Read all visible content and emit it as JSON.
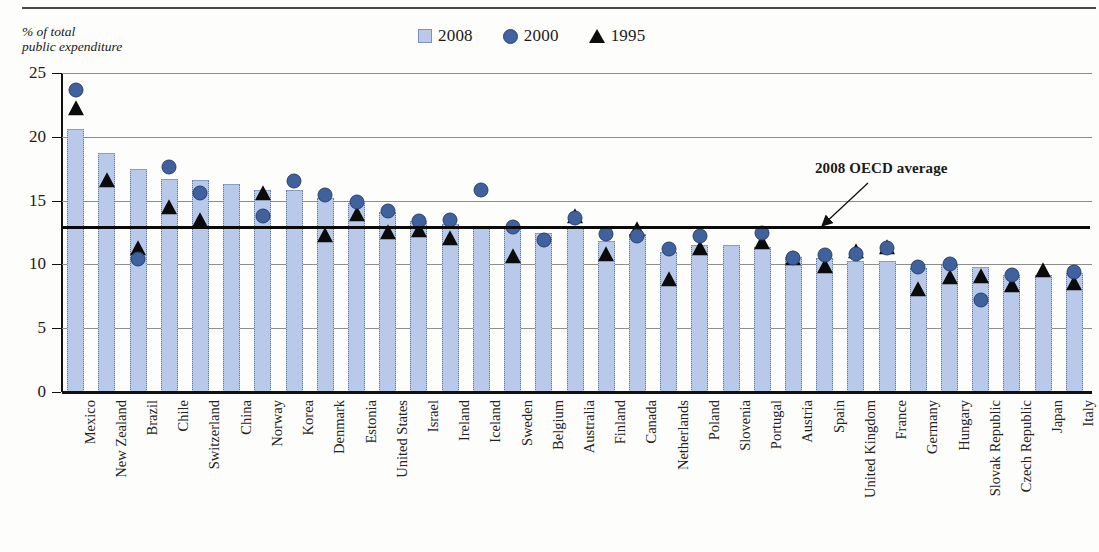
{
  "figure": {
    "y_axis_title": "% of total\npublic expenditure",
    "annotation": "2008 OECD average",
    "legend": [
      {
        "label": "2008",
        "marker": "bar-swatch-icon",
        "color": "#b9c9e9"
      },
      {
        "label": "2000",
        "marker": "circle-icon",
        "color": "#3f619e"
      },
      {
        "label": "1995",
        "marker": "triangle-icon",
        "color": "#0b0b0b"
      }
    ]
  },
  "chart_data": {
    "type": "bar",
    "title": "",
    "subtitle": "",
    "xlabel": "",
    "ylabel": "% of total public expenditure",
    "ylim": [
      0,
      25
    ],
    "yticks": [
      0,
      5,
      10,
      15,
      20,
      25
    ],
    "grid": true,
    "legend_position": "top-center",
    "annotations": [
      {
        "text": "2008 OECD average",
        "value": 12.9,
        "type": "reference-line"
      }
    ],
    "reference_line": {
      "label": "2008 OECD average",
      "value": 12.9
    },
    "categories": [
      "Mexico",
      "New Zealand",
      "Brazil",
      "Chile",
      "Switzerland",
      "China",
      "Norway",
      "Korea",
      "Denmark",
      "Estonia",
      "United States",
      "Israel",
      "Ireland",
      "Iceland",
      "Sweden",
      "Belgium",
      "Australia",
      "Finland",
      "Canada",
      "Netherlands",
      "Poland",
      "Slovenia",
      "Portugal",
      "Austria",
      "Spain",
      "United Kingdom",
      "France",
      "Germany",
      "Hungary",
      "Slovak Republic",
      "Czech Republic",
      "Japan",
      "Italy"
    ],
    "series": [
      {
        "name": "2008",
        "type": "bar",
        "values": [
          20.6,
          18.7,
          17.5,
          16.7,
          16.6,
          16.3,
          15.8,
          15.8,
          15.2,
          14.8,
          14.1,
          13.4,
          13.2,
          13.0,
          13.0,
          12.5,
          13.0,
          11.8,
          12.4,
          11.0,
          11.5,
          11.5,
          11.4,
          10.6,
          10.5,
          10.3,
          10.3,
          9.7,
          10.0,
          9.8,
          9.2,
          9.2,
          9.3
        ]
      },
      {
        "name": "2000",
        "type": "scatter",
        "marker": "circle",
        "values": [
          23.7,
          null,
          10.4,
          17.6,
          15.6,
          null,
          13.8,
          16.5,
          15.4,
          14.9,
          14.2,
          13.4,
          13.5,
          15.8,
          12.9,
          11.9,
          13.6,
          12.4,
          12.2,
          11.2,
          12.2,
          null,
          12.5,
          10.5,
          10.7,
          10.8,
          11.3,
          9.8,
          10.0,
          7.2,
          9.2,
          null,
          9.4
        ]
      },
      {
        "name": "1995",
        "type": "scatter",
        "marker": "triangle",
        "values": [
          22.2,
          16.5,
          11.2,
          14.4,
          13.4,
          null,
          15.5,
          null,
          12.2,
          13.9,
          12.5,
          12.6,
          12.0,
          null,
          10.6,
          null,
          13.7,
          10.7,
          12.7,
          8.8,
          11.2,
          null,
          11.7,
          10.4,
          9.8,
          11.0,
          11.3,
          8.0,
          8.9,
          9.0,
          8.3,
          9.5,
          8.5
        ]
      }
    ]
  }
}
